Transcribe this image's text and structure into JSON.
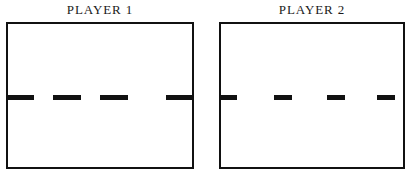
{
  "figure": {
    "background_color": "#ffffff",
    "line_color": "#111111",
    "panels": [
      {
        "id": "player-1",
        "title": "PLAYER 1",
        "box": {
          "x": 6,
          "y": 22,
          "width": 188,
          "height": 147,
          "border_width": 2
        },
        "centerline": {
          "y": 95,
          "thickness": 5,
          "style": "dashed",
          "dash_count": 4,
          "dash_length": 28,
          "gap_length": 19,
          "dashes": [
            {
              "x": 0,
              "width": 28
            },
            {
              "x": 47,
              "width": 28
            },
            {
              "x": 94,
              "width": 28
            },
            {
              "x": 160,
              "width": 28
            }
          ]
        }
      },
      {
        "id": "player-2",
        "title": "PLAYER 2",
        "box": {
          "x": 11,
          "y": 22,
          "width": 186,
          "height": 147,
          "border_width": 2
        },
        "centerline": {
          "y": 95,
          "thickness": 5,
          "style": "dashed",
          "dash_count": 4,
          "dash_length": 18,
          "gap_length": 29,
          "dashes": [
            {
              "x": 0,
              "width": 18
            },
            {
              "x": 55,
              "width": 18
            },
            {
              "x": 108,
              "width": 18
            },
            {
              "x": 158,
              "width": 18
            }
          ]
        }
      }
    ]
  }
}
